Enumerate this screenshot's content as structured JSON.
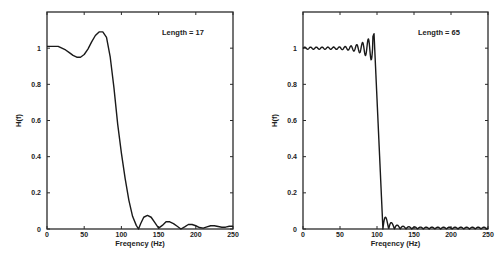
{
  "chart_data": [
    {
      "type": "line",
      "title": "",
      "annotation": "Length = 17",
      "xlabel": "Freqency (Hz)",
      "ylabel": "H(f)",
      "xlim": [
        0,
        250
      ],
      "ylim": [
        0,
        1.2
      ],
      "xticks": [
        0,
        50,
        100,
        150,
        200,
        250
      ],
      "xtick_labels": [
        "0",
        "50",
        "100",
        "150",
        "200",
        "250"
      ],
      "yticks": [
        0,
        0.2,
        0.4,
        0.6,
        0.8,
        1
      ],
      "ytick_labels": [
        "0",
        "0.2",
        "0.4",
        "0.6",
        "0.8",
        "1"
      ],
      "grid": false,
      "series": [
        {
          "name": "H(f)",
          "x": [
            0,
            5,
            10,
            15,
            20,
            25,
            30,
            35,
            40,
            45,
            50,
            55,
            60,
            65,
            70,
            75,
            80,
            85,
            90,
            95,
            100,
            105,
            110,
            115,
            120,
            123,
            126,
            130,
            135,
            140,
            145,
            150,
            155,
            160,
            165,
            170,
            175,
            180,
            185,
            190,
            195,
            200,
            205,
            210,
            215,
            220,
            225,
            230,
            235,
            240,
            245,
            250
          ],
          "y": [
            1.01,
            1.01,
            1.01,
            1.01,
            1.0,
            0.99,
            0.975,
            0.96,
            0.95,
            0.95,
            0.965,
            0.995,
            1.035,
            1.07,
            1.09,
            1.09,
            1.06,
            0.95,
            0.78,
            0.58,
            0.42,
            0.28,
            0.16,
            0.07,
            0.02,
            0.0,
            0.03,
            0.065,
            0.075,
            0.065,
            0.035,
            0.005,
            0.02,
            0.04,
            0.04,
            0.03,
            0.015,
            0.0,
            0.012,
            0.025,
            0.025,
            0.018,
            0.008,
            0.005,
            0.012,
            0.018,
            0.018,
            0.014,
            0.01,
            0.01,
            0.015,
            0.015
          ]
        }
      ]
    },
    {
      "type": "line",
      "title": "",
      "annotation": "Length = 65",
      "xlabel": "Freqency (Hz)",
      "ylabel": "H(f)",
      "xlim": [
        0,
        250
      ],
      "ylim": [
        0,
        1.2
      ],
      "xticks": [
        0,
        50,
        100,
        150,
        200,
        250
      ],
      "xtick_labels": [
        "0",
        "50",
        "100",
        "150",
        "200",
        "250"
      ],
      "yticks": [
        0,
        0.2,
        0.4,
        0.6,
        0.8,
        1
      ],
      "ytick_labels": [
        "0",
        "0.2",
        "0.4",
        "0.6",
        "0.8",
        "1"
      ],
      "grid": false,
      "series": [
        {
          "name": "H(f)",
          "model": "ripple",
          "passband_edge_hz": 96,
          "transition_end_hz": 108,
          "passband_ripple_period_hz": 7.8,
          "passband_peak": 1.08,
          "stopband_first_lobe": 0.09,
          "stopband_floor": 0.01
        }
      ]
    }
  ]
}
